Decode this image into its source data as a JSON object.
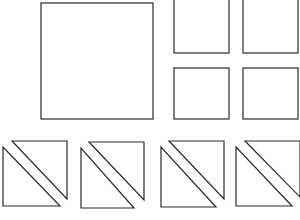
{
  "diagram": {
    "title": "",
    "stroke_color": "#2a2a2a",
    "background": "#ffffff",
    "large_square": {
      "x": 41,
      "y": 3,
      "width": 112,
      "height": 116
    },
    "small_squares": [
      {
        "x": 174,
        "y": -2,
        "width": 55,
        "height": 55
      },
      {
        "x": 243,
        "y": -2,
        "width": 55,
        "height": 55
      },
      {
        "x": 174,
        "y": 68,
        "width": 55,
        "height": 51
      },
      {
        "x": 243,
        "y": 68,
        "width": 55,
        "height": 51
      }
    ],
    "triangle_pairs": [
      {
        "lower": "3,147 3,206 60,206",
        "upper": "12,141 67,141 67,199"
      },
      {
        "lower": "81,148 81,208 134,208",
        "upper": "89,142 144,142 144,200"
      },
      {
        "lower": "161,147 161,207 216,207",
        "upper": "169,141 224,141 224,199"
      },
      {
        "lower": "236,147 236,206 292,206",
        "upper": "245,141 300,141 300,197"
      }
    ]
  }
}
